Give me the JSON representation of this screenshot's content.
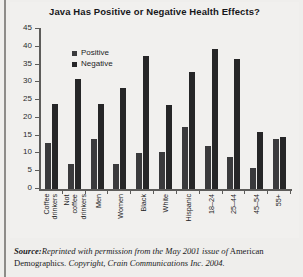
{
  "chart_data": {
    "type": "bar",
    "title": "Java Has Positive or Negative Health Effects?",
    "xlabel": "",
    "ylabel": "",
    "ylim": [
      0,
      45
    ],
    "ytick_step": 5,
    "yticks": [
      45,
      40,
      35,
      30,
      25,
      20,
      15,
      10,
      5,
      0
    ],
    "grid": false,
    "legend_position": "upper-left-inside",
    "categories": [
      "Coffee drinkers",
      "Not coffee drinkers",
      "Men",
      "Women",
      "Black",
      "White",
      "Hispanic",
      "18–24",
      "25–44",
      "45–54",
      "55+"
    ],
    "series": [
      {
        "name": "Positive",
        "color": "#3a3a3c",
        "values": [
          13,
          7,
          14,
          7,
          10,
          10.5,
          17.5,
          12,
          9,
          6,
          14
        ]
      },
      {
        "name": "Negative",
        "color": "#262627",
        "values": [
          24,
          31,
          24,
          28.5,
          37.5,
          23.5,
          33,
          39.5,
          36.5,
          16,
          14.5
        ]
      }
    ]
  },
  "source": {
    "label": "Source:",
    "line1": "Reprinted with permission from the May 2001 issue of",
    "line1_roman": " American",
    "line2_roman": "Demographics.",
    "line2_italic": " Copyright, Crain Communications Inc. 2004."
  }
}
